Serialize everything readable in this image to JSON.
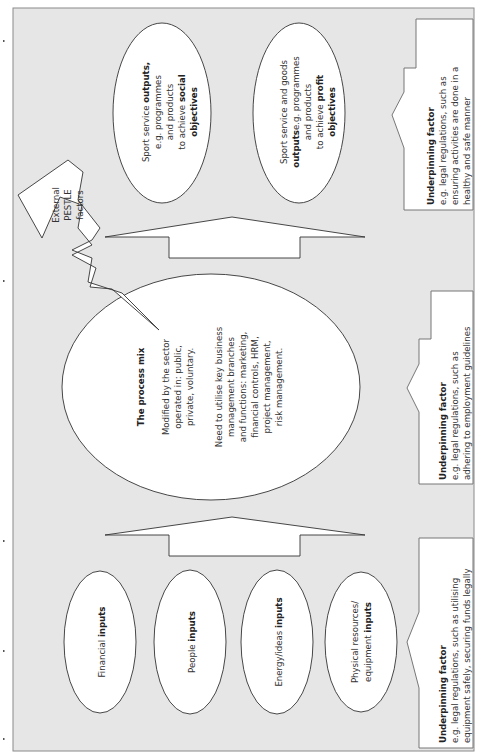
{
  "diagram": {
    "orientation": "rotated 90 degrees counter-clockwise",
    "colors": {
      "background": "#e6e6e6",
      "shape_fill": "#ffffff",
      "outline": "#333333"
    },
    "inputs": [
      {
        "label": "Financial",
        "bold": "inputs"
      },
      {
        "label": "People",
        "bold": "inputs"
      },
      {
        "label": "Energy/ideas",
        "bold": "inputs"
      },
      {
        "line1": "Physical resources/",
        "line2": "equipment",
        "bold": "inputs"
      }
    ],
    "process": {
      "title": "The process mix",
      "sector_lines": [
        "Modified by the sector",
        "operated in: public,",
        "private, voluntary."
      ],
      "functions_lines": [
        "Need to utilise key business",
        "management branches",
        "and functions: marketing,",
        "financial controls, HRM,",
        "project management,",
        "risk management."
      ]
    },
    "external": {
      "lines": [
        "External",
        "PESTLE",
        "factors"
      ]
    },
    "outputs": [
      {
        "lines": [
          "Sport service",
          "e.g. programmes",
          "and products",
          "to achieve"
        ],
        "bold_1": "outputs,",
        "bold_2": "social",
        "bold_3": "objectives"
      },
      {
        "lines": [
          "Sport service and goods",
          "e.g. programmes",
          "and products",
          "to achieve"
        ],
        "bold_1": "outputs",
        "bold_2": "profit",
        "bold_3": "objectives"
      }
    ],
    "underpinning": [
      {
        "title": "Underpinning factor",
        "lines": [
          "e.g. legal regulations, such as utilising",
          "equipment safely, securing funds legally"
        ]
      },
      {
        "title": "Underpinning factor",
        "lines": [
          "e.g. legal regulations, such as",
          "adhering to employment guidelines"
        ]
      },
      {
        "title": "Underpinning factor",
        "lines": [
          "e.g. legal regulations, such as",
          "ensuring activities are done in a",
          "healthy and safe manner"
        ]
      }
    ]
  }
}
